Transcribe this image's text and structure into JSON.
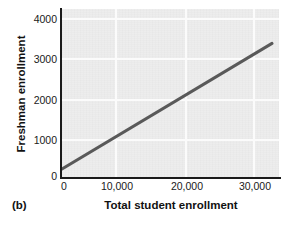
{
  "figure": {
    "panel_label": "(b)",
    "line_color": "#595959",
    "plot_background": "#ededed",
    "gridline_color": "#fbfbfb",
    "axis_color": "#1a1a1a"
  },
  "chart_data": {
    "type": "line",
    "title": "",
    "subtitle": "",
    "xlabel": "Total student enrollment",
    "ylabel": "Freshman enrollment",
    "xlim": [
      0,
      31000
    ],
    "ylim": [
      0,
      4150
    ],
    "xticks": [
      0,
      10000,
      20000,
      30000
    ],
    "xticklabels": [
      "0",
      "10,000",
      "20,000",
      "30,000"
    ],
    "yticks": [
      0,
      1000,
      2000,
      3000,
      4000
    ],
    "yticklabels": [
      "0",
      "1000",
      "2000",
      "3000",
      "4000"
    ],
    "grid": true,
    "legend": "none",
    "series": [
      {
        "name": "Regression line",
        "x": [
          0,
          30000
        ],
        "values": [
          200,
          3300
        ]
      }
    ],
    "annotations": [
      "(b)"
    ]
  }
}
